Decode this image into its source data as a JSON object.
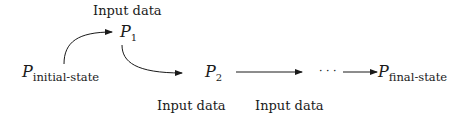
{
  "diagram": {
    "type": "state-transition-flow",
    "nodes": [
      {
        "id": "initial",
        "symbol": "P",
        "subscript": "initial-state"
      },
      {
        "id": "p1",
        "symbol": "P",
        "subscript": "1"
      },
      {
        "id": "p2",
        "symbol": "P",
        "subscript": "2"
      },
      {
        "id": "ellipsis",
        "text": "· · ·"
      },
      {
        "id": "final",
        "symbol": "P",
        "subscript": "final-state"
      }
    ],
    "edges": [
      {
        "from": "initial",
        "to": "p1",
        "label": "Input data",
        "style": "curved"
      },
      {
        "from": "p1",
        "to": "p2",
        "label": "Input data",
        "style": "curved"
      },
      {
        "from": "p2",
        "to": "ellipsis",
        "label": "Input data",
        "style": "straight"
      },
      {
        "from": "ellipsis",
        "to": "final",
        "label": "",
        "style": "straight"
      }
    ],
    "labels": {
      "top": "Input data",
      "bottom_left": "Input data",
      "bottom_right": "Input data"
    },
    "colors": {
      "stroke": "#1a1a1a",
      "background": "#ffffff"
    }
  }
}
